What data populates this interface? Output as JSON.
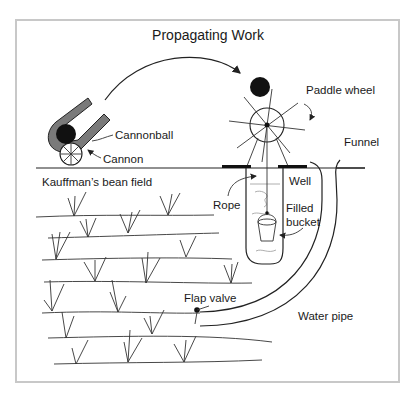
{
  "diagram": {
    "title": "Propagating Work",
    "labels": {
      "cannonball": "Cannonball",
      "cannon": "Cannon",
      "paddle_wheel": "Paddle wheel",
      "funnel": "Funnel",
      "kauffmans_bean_field": "Kauffman’s bean field",
      "well": "Well",
      "rope": "Rope",
      "filled_bucket_line1": "Filled",
      "filled_bucket_line2": "bucket",
      "flap_valve": "Flap valve",
      "water_pipe": "Water pipe"
    },
    "colors": {
      "ink": "#1a1a1a",
      "cannon_fill": "#7a7a7a",
      "frame_border": "#c8c8c8",
      "background": "#ffffff"
    }
  }
}
